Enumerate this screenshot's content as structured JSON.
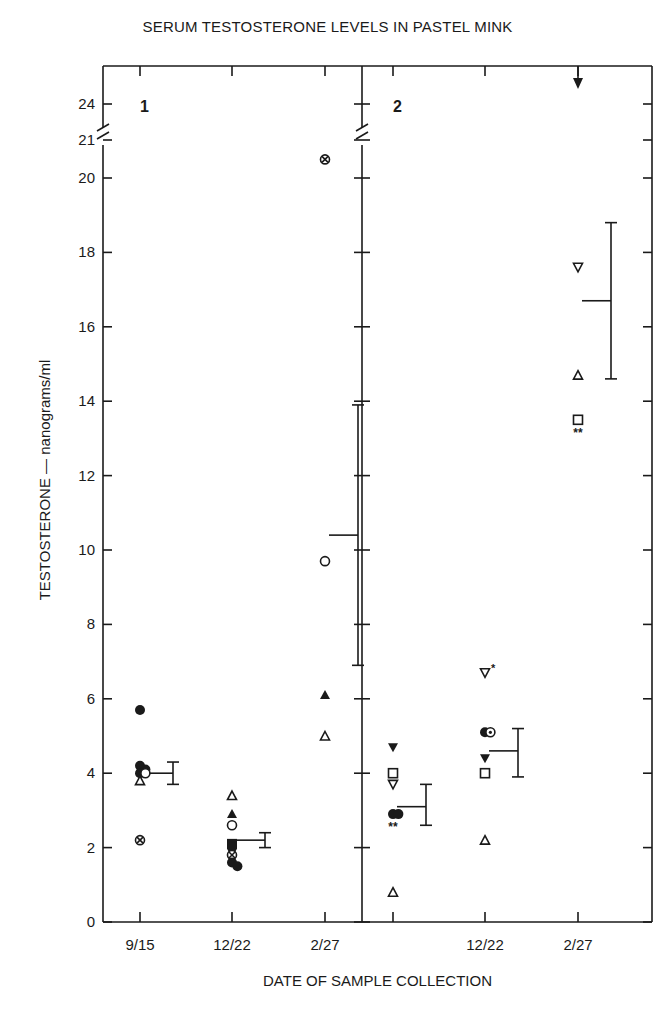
{
  "title": "SERUM TESTOSTERONE LEVELS IN PASTEL MINK",
  "xlabel": "DATE OF SAMPLE COLLECTION",
  "ylabel": "TESTOSTERONE — nanograms/ml",
  "colors": {
    "ink": "#1a1a1a",
    "background": "#ffffff"
  },
  "chart_data": {
    "type": "scatter",
    "title": "SERUM TESTOSTERONE LEVELS IN PASTEL MINK",
    "xlabel": "DATE OF SAMPLE COLLECTION",
    "ylabel": "TESTOSTERONE — nanograms/ml",
    "ylim": [
      0,
      24
    ],
    "y_axis_break": [
      20.5,
      21
    ],
    "y_ticks": [
      0,
      2,
      4,
      6,
      8,
      10,
      12,
      14,
      16,
      18,
      20,
      21,
      24
    ],
    "grid": false,
    "legend": "none",
    "panels": [
      {
        "label": "1",
        "x_ticks": [
          "9/15",
          "12/22",
          "2/27"
        ],
        "groups": [
          {
            "date": "9/15",
            "points": [
              {
                "marker": "filled-circle",
                "y": 5.7
              },
              {
                "marker": "filled-circle",
                "y": 4.2
              },
              {
                "marker": "filled-circle",
                "y": 4.1
              },
              {
                "marker": "filled-circle",
                "y": 4.0
              },
              {
                "marker": "open-circle",
                "y": 4.0
              },
              {
                "marker": "open-triangle",
                "y": 3.8
              },
              {
                "marker": "circle-cross",
                "y": 2.2
              }
            ],
            "mean": 4.0,
            "error_low": 3.7,
            "error_high": 4.3
          },
          {
            "date": "12/22",
            "points": [
              {
                "marker": "open-triangle",
                "y": 3.4
              },
              {
                "marker": "filled-triangle",
                "y": 2.9
              },
              {
                "marker": "open-circle",
                "y": 2.6
              },
              {
                "marker": "filled-square",
                "y": 2.1
              },
              {
                "marker": "filled-circle",
                "y": 2.0
              },
              {
                "marker": "circle-cross",
                "y": 1.8
              },
              {
                "marker": "filled-circle",
                "y": 1.6
              },
              {
                "marker": "filled-circle",
                "y": 1.5
              }
            ],
            "mean": 2.2,
            "error_low": 2.0,
            "error_high": 2.4
          },
          {
            "date": "2/27",
            "points": [
              {
                "marker": "circle-cross",
                "y": 20.5
              },
              {
                "marker": "open-circle",
                "y": 9.7
              },
              {
                "marker": "filled-triangle",
                "y": 6.1
              },
              {
                "marker": "open-triangle",
                "y": 5.0
              }
            ],
            "mean": 10.4,
            "error_low": 6.9,
            "error_high": 13.9
          }
        ]
      },
      {
        "label": "2",
        "x_ticks": [
          "",
          "12/22",
          "2/27"
        ],
        "groups": [
          {
            "date": "",
            "points": [
              {
                "marker": "filled-inverted-triangle",
                "y": 4.7
              },
              {
                "marker": "open-square",
                "y": 4.0
              },
              {
                "marker": "open-inverted-triangle",
                "y": 3.7
              },
              {
                "marker": "filled-circle",
                "y": 2.9
              },
              {
                "marker": "filled-circle",
                "y": 2.9
              },
              {
                "marker": "open-triangle",
                "y": 0.8
              }
            ],
            "annotation": "**",
            "mean": 3.1,
            "error_low": 2.6,
            "error_high": 3.7
          },
          {
            "date": "12/22",
            "points": [
              {
                "marker": "open-inverted-triangle",
                "y": 6.7,
                "annotation": "*"
              },
              {
                "marker": "filled-circle",
                "y": 5.1
              },
              {
                "marker": "circle-dot",
                "y": 5.1
              },
              {
                "marker": "filled-inverted-triangle",
                "y": 4.4
              },
              {
                "marker": "open-square",
                "y": 4.0
              },
              {
                "marker": "open-triangle",
                "y": 2.2
              }
            ],
            "annotation": "*",
            "mean": 4.6,
            "error_low": 3.9,
            "error_high": 5.2
          },
          {
            "date": "2/27",
            "points": [
              {
                "marker": "filled-inverted-triangle",
                "y": 24.5,
                "note": "off-scale arrow"
              },
              {
                "marker": "open-inverted-triangle",
                "y": 17.6
              },
              {
                "marker": "open-triangle",
                "y": 14.7
              },
              {
                "marker": "open-square",
                "y": 13.5
              }
            ],
            "annotation": "**",
            "mean": 16.7,
            "error_low": 14.6,
            "error_high": 18.8
          }
        ]
      }
    ]
  }
}
